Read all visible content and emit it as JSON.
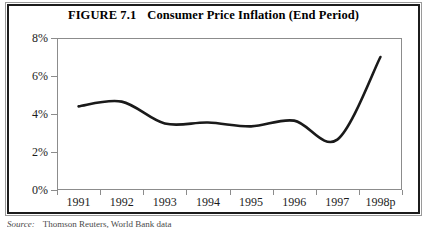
{
  "figure": {
    "title_number": "FIGURE 7.1",
    "title_text": "Consumer Price Inflation (End Period)",
    "source_label": "Source:",
    "source_text": "Thomson Reuters, World Bank data"
  },
  "chart_data": {
    "type": "line",
    "xlabel": "",
    "ylabel": "",
    "categories": [
      "1991",
      "1992",
      "1993",
      "1994",
      "1995",
      "1996",
      "1997",
      "1998p"
    ],
    "x_tick_labels": [
      "1991",
      "1992",
      "1993",
      "1994",
      "1995",
      "1996",
      "1997",
      "1998p"
    ],
    "y_tick_labels": [
      "0%",
      "2%",
      "4%",
      "6%",
      "8%"
    ],
    "y_tick_values": [
      0,
      2,
      4,
      6,
      8
    ],
    "ylim": [
      0,
      8
    ],
    "grid": false,
    "legend": null,
    "series": [
      {
        "name": "Consumer Price Inflation (End Period)",
        "color": "#1a1a1a",
        "values": [
          4.4,
          4.65,
          3.5,
          3.55,
          3.35,
          3.65,
          2.65,
          7.0
        ]
      }
    ],
    "annotations": []
  }
}
